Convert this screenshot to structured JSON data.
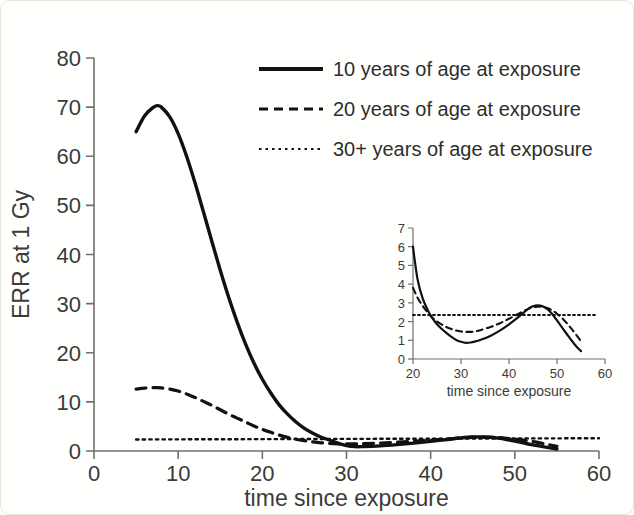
{
  "figure": {
    "background_color": "#fffffd",
    "line_color": "#111111",
    "axis_color": "#6f6f6f",
    "text_color": "#3b3b3b"
  },
  "chart_data": {
    "type": "line",
    "title": "",
    "xlabel": "time since exposure",
    "ylabel": "ERR at 1 Gy",
    "xlim": [
      0,
      60
    ],
    "ylim": [
      0,
      80
    ],
    "xticks": [
      0,
      10,
      20,
      30,
      40,
      50,
      60
    ],
    "yticks": [
      0,
      10,
      20,
      30,
      40,
      50,
      60,
      70,
      80
    ],
    "grid": false,
    "legend_position": "top-right",
    "series": [
      {
        "name": "10 years of age at exposure",
        "style": "solid",
        "x": [
          5,
          6,
          7,
          7.5,
          8,
          9,
          10,
          11,
          12,
          13,
          14,
          15,
          16,
          17,
          18,
          19,
          20,
          21,
          22,
          23,
          24,
          25,
          26,
          27,
          28,
          29,
          30,
          31,
          32,
          34,
          36,
          38,
          40,
          42,
          44,
          45,
          46,
          47,
          48,
          49,
          50,
          51,
          52,
          53,
          54,
          55
        ],
        "values": [
          65.0,
          68.2,
          69.9,
          70.3,
          70.0,
          68.0,
          64.6,
          60.0,
          54.6,
          48.7,
          42.7,
          36.8,
          31.3,
          26.3,
          21.8,
          17.9,
          14.6,
          11.8,
          9.4,
          7.5,
          5.9,
          4.6,
          3.6,
          2.8,
          2.2,
          1.6,
          1.1,
          0.88,
          0.9,
          1.05,
          1.3,
          1.6,
          1.95,
          2.35,
          2.75,
          2.85,
          2.86,
          2.8,
          2.62,
          2.35,
          2.0,
          1.65,
          1.3,
          1.0,
          0.7,
          0.4
        ]
      },
      {
        "name": "20 years of age at exposure",
        "style": "dashed",
        "x": [
          5,
          6,
          7,
          7.5,
          8,
          9,
          10,
          11,
          12,
          13,
          14,
          15,
          16,
          17,
          18,
          19,
          20,
          21,
          22,
          23,
          24,
          25,
          26,
          27,
          28,
          29,
          30,
          31,
          32,
          34,
          36,
          38,
          40,
          42,
          44,
          45,
          46,
          47,
          48,
          49,
          50,
          51,
          52,
          53,
          54,
          55
        ],
        "values": [
          12.6,
          12.8,
          12.88,
          12.9,
          12.85,
          12.6,
          12.2,
          11.6,
          10.9,
          10.1,
          9.3,
          8.4,
          7.5,
          6.7,
          5.9,
          5.1,
          4.4,
          3.8,
          3.25,
          2.78,
          2.4,
          2.1,
          1.85,
          1.66,
          1.53,
          1.47,
          1.45,
          1.46,
          1.5,
          1.62,
          1.8,
          2.0,
          2.2,
          2.45,
          2.7,
          2.78,
          2.82,
          2.8,
          2.72,
          2.6,
          2.42,
          2.2,
          1.95,
          1.65,
          1.3,
          0.95
        ]
      },
      {
        "name": "30+ years of age at exposure",
        "style": "dotted",
        "x": [
          5,
          60
        ],
        "values": [
          2.35,
          2.6
        ]
      }
    ]
  },
  "inset_chart_data": {
    "type": "line",
    "title": "",
    "xlabel": "time since exposure",
    "ylabel": "",
    "xlim": [
      20,
      60
    ],
    "ylim": [
      0,
      7
    ],
    "xticks": [
      20,
      30,
      40,
      50,
      60
    ],
    "yticks": [
      0,
      1,
      2,
      3,
      4,
      5,
      6,
      7
    ],
    "grid": false,
    "legend_position": "none",
    "series": [
      {
        "name": "10 years of age at exposure",
        "style": "solid",
        "x": [
          20,
          20.4,
          21,
          22,
          23,
          24,
          25,
          26,
          27,
          28,
          29,
          30,
          31,
          32,
          33,
          34,
          36,
          38,
          40,
          42,
          44,
          45,
          46,
          47,
          48,
          49,
          50,
          51,
          52,
          53,
          54,
          55
        ],
        "values": [
          6.0,
          5.2,
          4.2,
          3.25,
          2.65,
          2.2,
          1.86,
          1.6,
          1.38,
          1.18,
          1.02,
          0.92,
          0.86,
          0.88,
          0.94,
          1.02,
          1.22,
          1.5,
          1.85,
          2.25,
          2.68,
          2.82,
          2.87,
          2.82,
          2.66,
          2.4,
          2.06,
          1.7,
          1.35,
          1.0,
          0.68,
          0.42
        ]
      },
      {
        "name": "20 years of age at exposure",
        "style": "dashed",
        "x": [
          20,
          21,
          22,
          23,
          24,
          25,
          26,
          27,
          28,
          29,
          30,
          31,
          32,
          33,
          34,
          36,
          38,
          40,
          42,
          44,
          45,
          46,
          47,
          48,
          49,
          50,
          51,
          52,
          53,
          54,
          55
        ],
        "values": [
          3.8,
          3.25,
          2.85,
          2.5,
          2.22,
          2.0,
          1.84,
          1.7,
          1.6,
          1.52,
          1.47,
          1.45,
          1.45,
          1.48,
          1.54,
          1.7,
          1.9,
          2.15,
          2.42,
          2.68,
          2.76,
          2.8,
          2.79,
          2.72,
          2.6,
          2.42,
          2.2,
          1.93,
          1.62,
          1.3,
          0.95
        ]
      },
      {
        "name": "30+ years of age at exposure",
        "style": "dotted",
        "x": [
          20,
          58
        ],
        "values": [
          2.35,
          2.35
        ]
      }
    ]
  },
  "legend": {
    "entries": [
      {
        "label": "10 years of age at exposure",
        "style": "solid"
      },
      {
        "label": "20 years of age at exposure",
        "style": "dashed"
      },
      {
        "label": "30+ years of age at exposure",
        "style": "dotted"
      }
    ]
  }
}
